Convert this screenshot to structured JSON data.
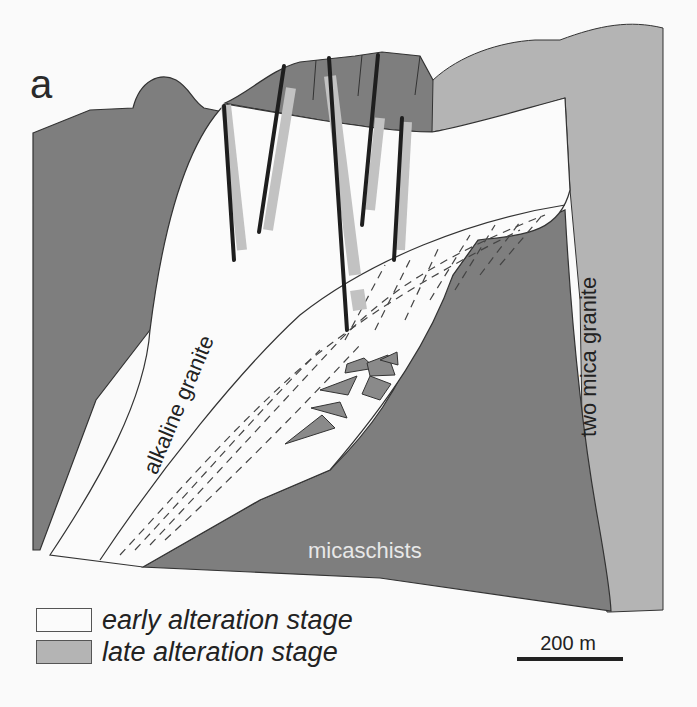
{
  "figure": {
    "panel_label": "a",
    "units": {
      "alkaline_granite": "alkaline granite",
      "two_mica_granite": "two mica granite",
      "micaschists": "micaschists"
    },
    "legend": [
      {
        "label": "early alteration stage",
        "color": "#fbfbfb"
      },
      {
        "label": "late alteration stage",
        "color": "#b4b4b4"
      }
    ],
    "scale_bar": {
      "label": "200 m"
    },
    "colors": {
      "background": "#fafafa",
      "dark_rock": "#7e7e7e",
      "light_rock": "#b4b4b4",
      "early_alteration": "#fbfbfb",
      "outline": "#333333",
      "vein_dark": "#1e1e1e",
      "vein_halo": "#c2c2c2",
      "micaschists_text": "#e8e8e8"
    }
  }
}
